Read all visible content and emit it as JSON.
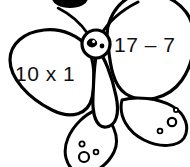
{
  "image": {
    "title": "Butterfly math fact clipart",
    "subject": "butterfly",
    "style": "black-and-white line art",
    "background_color": "#ffffff",
    "line_color": "#000000",
    "text_color": "#111111",
    "width": 190,
    "height": 167
  },
  "butterfly": {
    "upper_left_wing": {
      "label": "upper-left-wing",
      "expression": "10 x 1"
    },
    "upper_right_wing": {
      "label": "upper-right-wing",
      "expression": "17 – 7"
    },
    "lower_left_wing": {
      "label": "lower-left-wing",
      "spot_count": "3"
    },
    "lower_right_wing": {
      "label": "lower-right-wing",
      "spot_count": "3"
    },
    "head": {
      "label": "head",
      "eye_count": "2"
    },
    "body": {
      "label": "body"
    },
    "antenna": {
      "label": "antenna"
    }
  },
  "cropped_element": {
    "label": "cut-off dark oval at top edge"
  }
}
